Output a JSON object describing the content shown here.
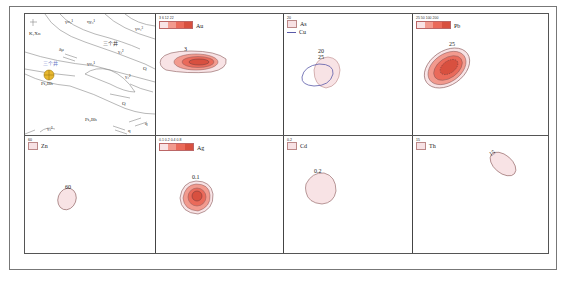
{
  "figure": {
    "panels": [
      {
        "id": "geology",
        "labels": {
          "kxn": "K₁Xn",
          "gamma_o_1": "γo₄¹",
          "eta_gamma": "ηγ₃¹",
          "gamma_o_2": "γo₄³",
          "sangeji_upper": "三个井",
          "delta_mu": "δμ",
          "sangeji_mine": "三个井",
          "gamma_o_3": "γo₄¹",
          "gamma_3": "γ₃²",
          "gamma_4": "γ₃²",
          "q1": "Q",
          "q2": "Q",
          "pt_upper": "Pt₂Bh",
          "pt_lower": "Pt₂Bh",
          "gamma_5": "γ₃²",
          "q_small1": "q",
          "q_small2": "q"
        }
      },
      {
        "id": "au",
        "element": "Au",
        "legend_ticks": "3  6  12  22",
        "contour_label": "3"
      },
      {
        "id": "as_cu",
        "element_1": "As",
        "element_2": "Cu",
        "legend_tick": "20",
        "contour_labels": [
          "20",
          "25"
        ]
      },
      {
        "id": "pb",
        "element": "Pb",
        "legend_ticks": "25  50  100  200",
        "contour_label": "25"
      },
      {
        "id": "zn",
        "element": "Zn",
        "legend_tick": "60",
        "contour_label": "60"
      },
      {
        "id": "ag",
        "element": "Ag",
        "legend_ticks": "0.1  0.2  0.4  0.8",
        "contour_label": "0.1"
      },
      {
        "id": "cd",
        "element": "Cd",
        "legend_tick": "0.2",
        "contour_label": "0.2"
      },
      {
        "id": "th",
        "element": "Th",
        "legend_tick": "15",
        "contour_label": "15"
      }
    ],
    "colors": {
      "level1": "#f8e3e5",
      "level2": "#f29a8e",
      "level3": "#ea6a5a",
      "level4": "#d8503f",
      "outline": "#8a5a5a",
      "cu_line": "#5a5aa8",
      "mine_symbol": "#e8b830",
      "mine_text": "#6a7ac8"
    }
  }
}
